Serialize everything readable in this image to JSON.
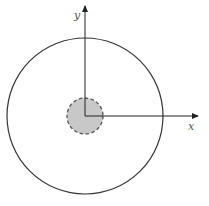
{
  "diagram": {
    "axes": {
      "x_label": "x",
      "y_label": "y"
    },
    "outer_circle": {
      "cx": 85,
      "cy": 116,
      "r": 78,
      "stroke": "#333333",
      "style": "solid"
    },
    "inner_circle": {
      "cx": 85,
      "cy": 116,
      "r": 18,
      "fill": "#c8c8c8",
      "stroke": "#555555",
      "style": "dashed"
    },
    "colors": {
      "axis": "#222222",
      "background": "#ffffff"
    }
  }
}
